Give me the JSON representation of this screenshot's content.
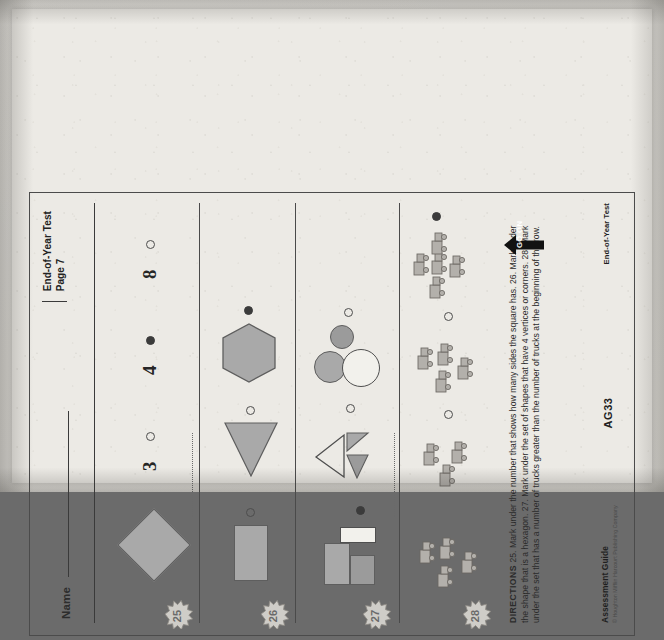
{
  "document": {
    "test_name": "End-of-Year Test",
    "page_label": "Page 7",
    "name_field_label": "Name",
    "name_field_value": "",
    "page_code": "AG33",
    "footer_title": "Assessment Guide",
    "footer_copyright": "© Houghton Mifflin Harcourt Publishing Company",
    "footer_right_label": "End-of-Year Test",
    "go_on_label": "GO ON"
  },
  "directions": {
    "heading": "DIRECTIONS",
    "body": "25. Mark under the number that shows how many sides the square has.  26. Mark under the shape that is a hexagon.  27. Mark under the set of shapes that have 4 vertices or corners.  28. Mark under the set that has a number of trucks greater than the number of trucks at the beginning of the row."
  },
  "questions": [
    {
      "number": "25",
      "prompt": "Mark under the number that shows how many sides the square has.",
      "stem_shape": "diamond-square",
      "options": [
        {
          "label": "3",
          "type": "numeral",
          "marked": false
        },
        {
          "label": "4",
          "type": "numeral",
          "marked": true
        },
        {
          "label": "8",
          "type": "numeral",
          "marked": false
        }
      ]
    },
    {
      "number": "26",
      "prompt": "Mark under the shape that is a hexagon.",
      "stem_shape": "rectangle",
      "options": [
        {
          "label": "rectangle",
          "type": "shape",
          "marked": false
        },
        {
          "label": "triangle",
          "type": "shape",
          "marked": false
        },
        {
          "label": "hexagon",
          "type": "shape",
          "marked": true
        }
      ]
    },
    {
      "number": "27",
      "prompt": "Mark under the set of shapes that have 4 vertices or corners.",
      "stem_shape": "rectangles-set",
      "options": [
        {
          "label": "three rectangles",
          "type": "shape-set",
          "marked": true
        },
        {
          "label": "three triangles",
          "type": "shape-set",
          "marked": false
        },
        {
          "label": "three circles",
          "type": "shape-set",
          "marked": false
        }
      ]
    },
    {
      "number": "28",
      "prompt": "Mark under the set that has a number of trucks greater than the number of trucks at the beginning of the row.",
      "stem_shape": "trucks-4",
      "options": [
        {
          "label": "3 trucks",
          "type": "truck-set",
          "count": "3",
          "marked": false
        },
        {
          "label": "4 trucks",
          "type": "truck-set",
          "count": "4",
          "marked": false
        },
        {
          "label": "5 trucks",
          "type": "truck-set",
          "count": "5",
          "marked": true
        }
      ]
    }
  ],
  "colors": {
    "paper": "#eceae5",
    "ink": "#2b2b2b",
    "shape_fill": "#a9a9a9",
    "shape_fill_dark": "#9b9b9b",
    "rule": "#4a4a4a",
    "bubble_filled": "#3b3b3b"
  }
}
